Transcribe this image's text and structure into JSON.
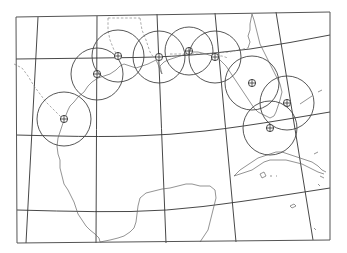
{
  "map": {
    "type": "radar coverage map",
    "region": "Gulf of Mexico",
    "colors": {
      "background": "#ffffff",
      "lines": "#333333",
      "coastline": "#666666"
    },
    "frame": {
      "points": [
        [
          16,
          17
        ],
        [
          330,
          12
        ],
        [
          330,
          240
        ],
        [
          17,
          243
        ]
      ]
    },
    "graticule": {
      "meridians": [
        [
          [
            38,
            17
          ],
          [
            26,
            243
          ]
        ],
        [
          [
            97,
            16
          ],
          [
            96,
            243
          ]
        ],
        [
          [
            157,
            14
          ],
          [
            166,
            243
          ]
        ],
        [
          [
            215,
            13
          ],
          [
            236,
            242
          ]
        ],
        [
          [
            276,
            12
          ],
          [
            313,
            240
          ]
        ]
      ],
      "parallels": [
        [
          [
            16,
            59
          ],
          [
            100,
            58
          ],
          [
            170,
            57
          ],
          [
            250,
            50
          ],
          [
            330,
            35
          ]
        ],
        [
          [
            16,
            135
          ],
          [
            100,
            137
          ],
          [
            170,
            135
          ],
          [
            240,
            127
          ],
          [
            330,
            112
          ]
        ],
        [
          [
            17,
            210
          ],
          [
            96,
            212
          ],
          [
            166,
            211
          ],
          [
            240,
            202
          ],
          [
            330,
            188
          ]
        ]
      ]
    },
    "coverage_sites": [
      {
        "id": 1,
        "cx": 64,
        "cy": 119,
        "r": 27
      },
      {
        "id": 2,
        "cx": 97,
        "cy": 74,
        "r": 26
      },
      {
        "id": 3,
        "cx": 118,
        "cy": 56,
        "r": 26
      },
      {
        "id": 4,
        "cx": 159,
        "cy": 57,
        "r": 26
      },
      {
        "id": 5,
        "cx": 189,
        "cy": 51,
        "r": 24
      },
      {
        "id": 6,
        "cx": 215,
        "cy": 57,
        "r": 26
      },
      {
        "id": 7,
        "cx": 252,
        "cy": 83,
        "r": 27
      },
      {
        "id": 8,
        "cx": 287,
        "cy": 103,
        "r": 27
      },
      {
        "id": 9,
        "cx": 270,
        "cy": 128,
        "r": 27
      }
    ],
    "site_marker": "circled-plus"
  }
}
